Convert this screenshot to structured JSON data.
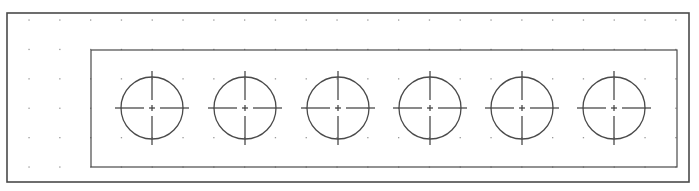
{
  "drawing": {
    "background": "#ffffff",
    "line_color": "#4a4a4a",
    "grid_dot_color": "#9a9a9a",
    "cropped_label": "—",
    "outer_frame": {
      "x": 7,
      "y": 13,
      "width": 682,
      "height": 169
    },
    "inner_plate": {
      "x": 91,
      "y": 50,
      "width": 586,
      "height": 117
    },
    "grid": {
      "x0": 29,
      "y0": 20,
      "dx": 30.8,
      "dy": 29.4,
      "cols": 22,
      "rows": 6
    },
    "holes": [
      {
        "cx": 152,
        "cy": 108,
        "r": 31
      },
      {
        "cx": 245,
        "cy": 108,
        "r": 31
      },
      {
        "cx": 338,
        "cy": 108,
        "r": 31
      },
      {
        "cx": 430,
        "cy": 108,
        "r": 31
      },
      {
        "cx": 522,
        "cy": 108,
        "r": 31
      },
      {
        "cx": 614,
        "cy": 108,
        "r": 31
      }
    ],
    "centerline_extension": 6
  }
}
